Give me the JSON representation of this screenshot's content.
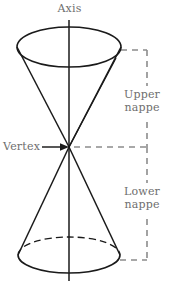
{
  "figure": {
    "name": "double-napped-cone",
    "background_color": "#ffffff",
    "stroke_color": "#1a1a1a",
    "dash_color": "#8c8c8c",
    "label_color": "#6e6e6e",
    "labels": {
      "axis": "Axis",
      "vertex": "Vertex",
      "upper_nappe_line1": "Upper",
      "upper_nappe_line2": "nappe",
      "lower_nappe_line1": "Lower",
      "lower_nappe_line2": "nappe"
    },
    "geometry": {
      "axis_x": 69,
      "axis_top_y": 20,
      "axis_bottom_y": 281,
      "vertex_x": 69,
      "vertex_y": 147,
      "top_ellipse_cx": 69,
      "top_ellipse_cy": 47,
      "top_ellipse_rx": 52,
      "top_ellipse_ry": 20,
      "bottom_ellipse_cx": 69,
      "bottom_ellipse_cy": 255,
      "bottom_ellipse_rx": 51,
      "bottom_ellipse_ry": 18,
      "bracket_x": 147,
      "bracket_top_y": 50,
      "bracket_bottom_y": 260,
      "bracket_mid_y": 147
    }
  }
}
